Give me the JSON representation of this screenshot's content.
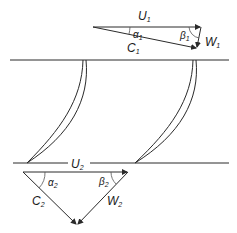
{
  "diagram": {
    "title": "",
    "inlet_triangle": {
      "blade_velocity": {
        "symbol": "U",
        "subscript": "1"
      },
      "absolute_velocity": {
        "symbol": "C",
        "subscript": "1"
      },
      "relative_velocity": {
        "symbol": "W",
        "subscript": "1"
      },
      "absolute_angle": {
        "symbol": "α",
        "subscript": "1"
      },
      "relative_angle": {
        "symbol": "β",
        "subscript": "1"
      }
    },
    "outlet_triangle": {
      "blade_velocity": {
        "symbol": "U",
        "subscript": "2"
      },
      "absolute_velocity": {
        "symbol": "C",
        "subscript": "2"
      },
      "relative_velocity": {
        "symbol": "W",
        "subscript": "2"
      },
      "absolute_angle": {
        "symbol": "α",
        "subscript": "2"
      },
      "relative_angle": {
        "symbol": "β",
        "subscript": "2"
      }
    },
    "blades": [
      "blade-1",
      "blade-2"
    ],
    "colors": {
      "line": "#2a2a2a",
      "background": "#ffffff"
    }
  }
}
